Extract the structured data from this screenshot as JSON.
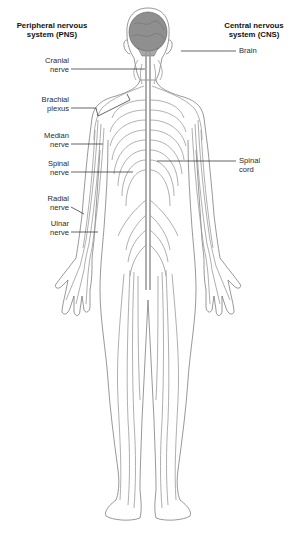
{
  "diagram": {
    "title_left": {
      "line1": "Peripheral nervous",
      "line2": "system (PNS)"
    },
    "title_right": {
      "line1": "Central nervous",
      "line2": "system (CNS)"
    },
    "labels_left": [
      {
        "id": "cranial",
        "line1": "Cranial",
        "line2": "nerve"
      },
      {
        "id": "brachial",
        "line1": "Brachial",
        "line2": "plexus"
      },
      {
        "id": "median",
        "line1": "Median",
        "line2": "nerve"
      },
      {
        "id": "spinal-nerve",
        "line1": "Spinal",
        "line2": "nerve"
      },
      {
        "id": "radial",
        "line1": "Radial",
        "line2": "nerve"
      },
      {
        "id": "ulnar",
        "line1": "Ulnar",
        "line2": "nerve"
      }
    ],
    "labels_right": [
      {
        "id": "brain",
        "line1": "Brain",
        "line2": ""
      },
      {
        "id": "spinal-cord",
        "line1": "Spinal",
        "line2": "cord"
      }
    ],
    "colors": {
      "outline": "#6b6b6b",
      "nerve": "#9a9a9a",
      "brain_fill": "#8a8a8a",
      "leader": "#222222"
    }
  }
}
